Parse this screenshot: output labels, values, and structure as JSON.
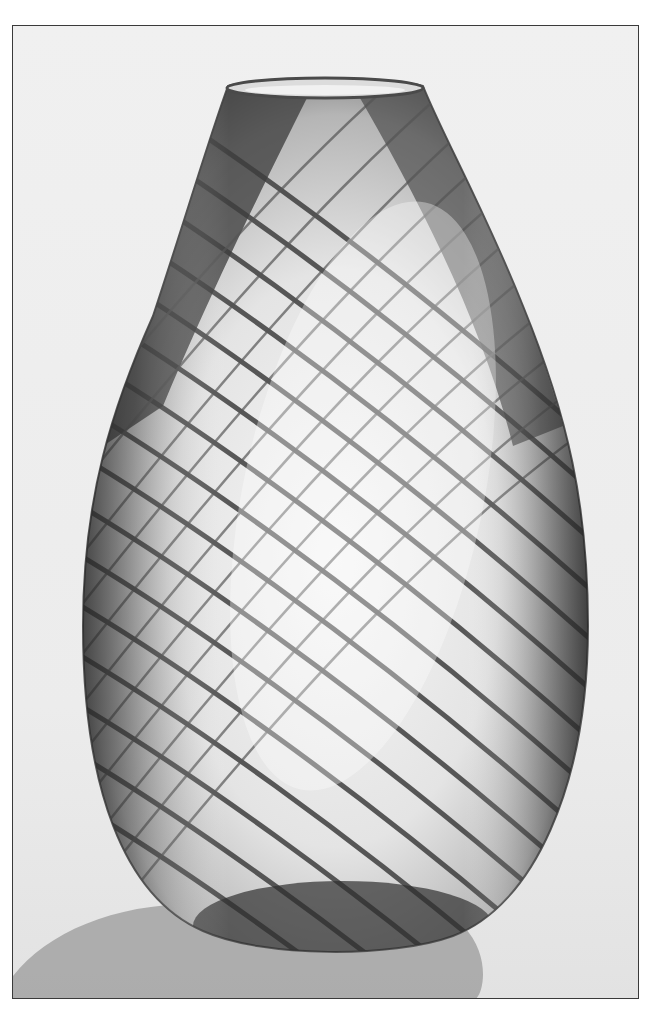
{
  "image": {
    "subject": "Glass vase with spiral stripe pattern",
    "style": "black-and-white photograph",
    "colors": {
      "background": "#eeeeee",
      "border": "#3a3a3a",
      "shadow": "#a8a8a8",
      "glass_dark": "#3c3c3c",
      "glass_light": "#f4f4f4",
      "stripe": "#4a4a4a"
    }
  }
}
